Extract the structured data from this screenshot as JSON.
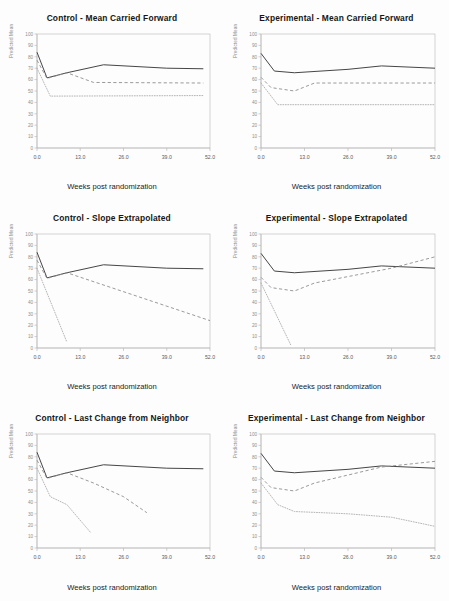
{
  "figure": {
    "rows": 3,
    "cols": 2,
    "background": "#fdfdfd",
    "xlabel": "Weeks post randomization",
    "ylabel": "Predicted Mean",
    "xticks": [
      "0.0",
      "13.0",
      "26.0",
      "39.0",
      "52.0"
    ],
    "yticks": [
      "0",
      "10",
      "20",
      "30",
      "40",
      "50",
      "60",
      "70",
      "80",
      "90",
      "100"
    ],
    "colors": {
      "solid": "#3b3b3b",
      "dashed": "#8e8e8e",
      "dotted": "#a8a8a8",
      "frame": "#c0c0c0",
      "tick_text": "#8e8e8e"
    }
  },
  "chart_data": [
    {
      "type": "line",
      "title": "Control - Mean Carried Forward",
      "xlabel": "Weeks post randomization",
      "ylabel": "Predicted Mean",
      "xlim": [
        0,
        52
      ],
      "ylim": [
        0,
        100
      ],
      "xticks": [
        0,
        13,
        26,
        39,
        52
      ],
      "yticks": [
        0,
        10,
        20,
        30,
        40,
        50,
        60,
        70,
        80,
        90,
        100
      ],
      "grid": false,
      "legend": "none",
      "series": [
        {
          "name": "solid",
          "style": "solid",
          "x": [
            0,
            3,
            9,
            20,
            39,
            50
          ],
          "y": [
            84,
            61.5,
            66,
            73,
            70,
            69.5
          ]
        },
        {
          "name": "dashed",
          "style": "dashed",
          "x": [
            0,
            3,
            9,
            17,
            50
          ],
          "y": [
            77,
            61,
            66,
            57.5,
            57
          ]
        },
        {
          "name": "dotted",
          "style": "dotted",
          "x": [
            0,
            4,
            50
          ],
          "y": [
            70,
            45.5,
            46
          ]
        }
      ]
    },
    {
      "type": "line",
      "title": "Experimental - Mean Carried Forward",
      "xlabel": "Weeks post randomization",
      "ylabel": "Predicted Mean",
      "xlim": [
        0,
        52
      ],
      "ylim": [
        0,
        100
      ],
      "xticks": [
        0,
        13,
        26,
        39,
        52
      ],
      "yticks": [
        0,
        10,
        20,
        30,
        40,
        50,
        60,
        70,
        80,
        90,
        100
      ],
      "grid": false,
      "legend": "none",
      "series": [
        {
          "name": "solid",
          "style": "solid",
          "x": [
            0,
            4,
            10,
            26,
            36,
            52
          ],
          "y": [
            83,
            67.5,
            66,
            69,
            72,
            70
          ]
        },
        {
          "name": "dashed",
          "style": "dashed",
          "x": [
            0,
            3,
            10,
            16,
            52
          ],
          "y": [
            62,
            53,
            50,
            57,
            57
          ]
        },
        {
          "name": "dotted",
          "style": "dotted",
          "x": [
            0,
            5,
            52
          ],
          "y": [
            57,
            38,
            38
          ]
        }
      ]
    },
    {
      "type": "line",
      "title": "Control - Slope Extrapolated",
      "xlabel": "Weeks post randomization",
      "ylabel": "Predicted Mean",
      "xlim": [
        0,
        52
      ],
      "ylim": [
        0,
        100
      ],
      "xticks": [
        0,
        13,
        26,
        39,
        52
      ],
      "yticks": [
        0,
        10,
        20,
        30,
        40,
        50,
        60,
        70,
        80,
        90,
        100
      ],
      "grid": false,
      "legend": "none",
      "series": [
        {
          "name": "solid",
          "style": "solid",
          "x": [
            0,
            3,
            9,
            20,
            39,
            50
          ],
          "y": [
            84,
            61.5,
            66,
            73,
            70,
            69.5
          ]
        },
        {
          "name": "dashed",
          "style": "dashed",
          "x": [
            0,
            3,
            9,
            52
          ],
          "y": [
            77,
            61,
            66,
            24
          ]
        },
        {
          "name": "dotted",
          "style": "dotted",
          "x": [
            0,
            9
          ],
          "y": [
            70,
            5
          ]
        }
      ]
    },
    {
      "type": "line",
      "title": "Experimental - Slope Extrapolated",
      "xlabel": "Weeks post randomization",
      "ylabel": "Predicted Mean",
      "xlim": [
        0,
        52
      ],
      "ylim": [
        0,
        100
      ],
      "xticks": [
        0,
        13,
        26,
        39,
        52
      ],
      "yticks": [
        0,
        10,
        20,
        30,
        40,
        50,
        60,
        70,
        80,
        90,
        100
      ],
      "grid": false,
      "legend": "none",
      "series": [
        {
          "name": "solid",
          "style": "solid",
          "x": [
            0,
            4,
            10,
            26,
            36,
            52
          ],
          "y": [
            83,
            67.5,
            66,
            69,
            72,
            70
          ]
        },
        {
          "name": "dashed",
          "style": "dashed",
          "x": [
            0,
            3,
            10,
            16,
            39,
            52
          ],
          "y": [
            62,
            53,
            50,
            57,
            70,
            80
          ]
        },
        {
          "name": "dotted",
          "style": "dotted",
          "x": [
            0,
            9
          ],
          "y": [
            57,
            2
          ]
        }
      ]
    },
    {
      "type": "line",
      "title": "Control - Last Change from Neighbor",
      "xlabel": "Weeks post randomization",
      "ylabel": "Predicted Mean",
      "xlim": [
        0,
        52
      ],
      "ylim": [
        0,
        100
      ],
      "xticks": [
        0,
        13,
        26,
        39,
        52
      ],
      "yticks": [
        0,
        10,
        20,
        30,
        40,
        50,
        60,
        70,
        80,
        90,
        100
      ],
      "grid": false,
      "legend": "none",
      "series": [
        {
          "name": "solid",
          "style": "solid",
          "x": [
            0,
            3,
            9,
            20,
            39,
            50
          ],
          "y": [
            84,
            61.5,
            66,
            73,
            70,
            69.5
          ]
        },
        {
          "name": "dashed",
          "style": "dashed",
          "x": [
            0,
            3,
            9,
            17,
            26,
            33
          ],
          "y": [
            77,
            61,
            66,
            57,
            45,
            31
          ]
        },
        {
          "name": "dotted",
          "style": "dotted",
          "x": [
            0,
            4,
            9,
            16
          ],
          "y": [
            70,
            45,
            38,
            14
          ]
        }
      ]
    },
    {
      "type": "line",
      "title": "Experimental - Last Change from Neighbor",
      "xlabel": "Weeks post randomization",
      "ylabel": "Predicted Mean",
      "xlim": [
        0,
        52
      ],
      "ylim": [
        0,
        100
      ],
      "xticks": [
        0,
        13,
        26,
        39,
        52
      ],
      "yticks": [
        0,
        10,
        20,
        30,
        40,
        50,
        60,
        70,
        80,
        90,
        100
      ],
      "grid": false,
      "legend": "none",
      "series": [
        {
          "name": "solid",
          "style": "solid",
          "x": [
            0,
            4,
            10,
            26,
            36,
            52
          ],
          "y": [
            83,
            67.5,
            66,
            69,
            72,
            70
          ]
        },
        {
          "name": "dashed",
          "style": "dashed",
          "x": [
            0,
            3,
            10,
            16,
            26,
            36,
            52
          ],
          "y": [
            62,
            53,
            50,
            57,
            64,
            71,
            76
          ]
        },
        {
          "name": "dotted",
          "style": "dotted",
          "x": [
            0,
            5,
            10,
            26,
            39,
            52
          ],
          "y": [
            57,
            38,
            32,
            30,
            27,
            19
          ]
        }
      ]
    }
  ]
}
